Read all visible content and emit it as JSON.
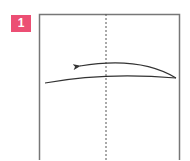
{
  "step": {
    "number": "1",
    "badge_color": "#ec4f74"
  },
  "diagram": {
    "paper_square": {
      "stroke": "#777777"
    },
    "fold_line": {
      "style": "dashed",
      "orientation": "vertical",
      "stroke": "#555555"
    },
    "fold_curve": {
      "stroke": "#333333"
    },
    "arrow": {
      "direction": "left",
      "stroke": "#333333"
    }
  }
}
